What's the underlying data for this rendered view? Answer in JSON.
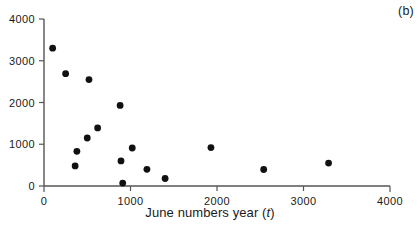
{
  "figure": {
    "panel_label": "(b)",
    "xlabel_main": "June numbers year (",
    "xlabel_var": "t",
    "xlabel_close": ")"
  },
  "chart_data": {
    "type": "scatter",
    "title": "",
    "subtitle": "",
    "panel": "(b)",
    "xlabel": "June numbers year (t)",
    "ylabel": "",
    "xlim": [
      0,
      4000
    ],
    "ylim": [
      0,
      4000
    ],
    "xticks": [
      0,
      1000,
      2000,
      3000,
      4000
    ],
    "yticks": [
      0,
      1000,
      2000,
      3000,
      4000
    ],
    "xtick_labels": [
      "0",
      "1000",
      "2000",
      "3000",
      "4000"
    ],
    "ytick_labels": [
      "0",
      "1000",
      "2000",
      "3000",
      "4000"
    ],
    "grid": false,
    "legend": null,
    "marker": "filled-circle",
    "marker_color": "#111111",
    "marker_size": 6,
    "axis_color": "#555555",
    "points": [
      {
        "x": 100,
        "y": 3300
      },
      {
        "x": 250,
        "y": 2690
      },
      {
        "x": 520,
        "y": 2550
      },
      {
        "x": 880,
        "y": 1930
      },
      {
        "x": 620,
        "y": 1390
      },
      {
        "x": 500,
        "y": 1150
      },
      {
        "x": 1020,
        "y": 910
      },
      {
        "x": 1930,
        "y": 920
      },
      {
        "x": 380,
        "y": 830
      },
      {
        "x": 890,
        "y": 600
      },
      {
        "x": 3290,
        "y": 550
      },
      {
        "x": 360,
        "y": 480
      },
      {
        "x": 1190,
        "y": 400
      },
      {
        "x": 2540,
        "y": 395
      },
      {
        "x": 1400,
        "y": 180
      },
      {
        "x": 910,
        "y": 70
      }
    ]
  }
}
